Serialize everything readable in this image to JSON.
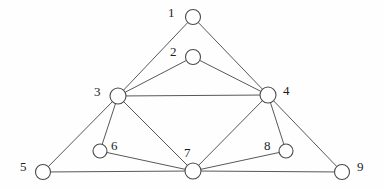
{
  "figure": {
    "type": "undirected-graph-diagram",
    "background_color": "#fefefe",
    "edge_color": "#58585c",
    "node_fill_color": "#ffffff",
    "node_stroke_color": "#4a4a4e",
    "label_color": "#1d1d1f",
    "width": 384,
    "height": 189
  },
  "graph": {
    "node_count": 9,
    "edge_count": 15,
    "nodes": [
      {
        "id": "1",
        "label": "1",
        "cx": 193,
        "cy": 17,
        "r": 7.5,
        "label_x": 168,
        "label_y": 6,
        "degree": 2
      },
      {
        "id": "2",
        "label": "2",
        "cx": 193,
        "cy": 57,
        "r": 7.5,
        "label_x": 170,
        "label_y": 45,
        "degree": 2
      },
      {
        "id": "3",
        "label": "3",
        "cx": 118,
        "cy": 96,
        "r": 8.0,
        "label_x": 94,
        "label_y": 85,
        "degree": 6
      },
      {
        "id": "4",
        "label": "4",
        "cx": 268,
        "cy": 95,
        "r": 8.0,
        "label_x": 283,
        "label_y": 84,
        "degree": 6
      },
      {
        "id": "5",
        "label": "5",
        "cx": 43,
        "cy": 172,
        "r": 7.5,
        "label_x": 20,
        "label_y": 160,
        "degree": 2
      },
      {
        "id": "6",
        "label": "6",
        "cx": 100,
        "cy": 151,
        "r": 7.0,
        "label_x": 111,
        "label_y": 139,
        "degree": 2
      },
      {
        "id": "7",
        "label": "7",
        "cx": 193,
        "cy": 171,
        "r": 8.0,
        "label_x": 184,
        "label_y": 146,
        "degree": 6
      },
      {
        "id": "8",
        "label": "8",
        "cx": 286,
        "cy": 151,
        "r": 7.0,
        "label_x": 264,
        "label_y": 139,
        "degree": 2
      },
      {
        "id": "9",
        "label": "9",
        "cx": 342,
        "cy": 172,
        "r": 7.5,
        "label_x": 357,
        "label_y": 160,
        "degree": 2
      }
    ],
    "edges": [
      {
        "source": "1",
        "target": "3"
      },
      {
        "source": "1",
        "target": "4"
      },
      {
        "source": "2",
        "target": "3"
      },
      {
        "source": "2",
        "target": "4"
      },
      {
        "source": "3",
        "target": "4"
      },
      {
        "source": "3",
        "target": "5"
      },
      {
        "source": "3",
        "target": "6"
      },
      {
        "source": "3",
        "target": "7"
      },
      {
        "source": "4",
        "target": "7"
      },
      {
        "source": "4",
        "target": "8"
      },
      {
        "source": "4",
        "target": "9"
      },
      {
        "source": "5",
        "target": "7"
      },
      {
        "source": "6",
        "target": "7"
      },
      {
        "source": "7",
        "target": "8"
      },
      {
        "source": "7",
        "target": "9"
      }
    ]
  }
}
